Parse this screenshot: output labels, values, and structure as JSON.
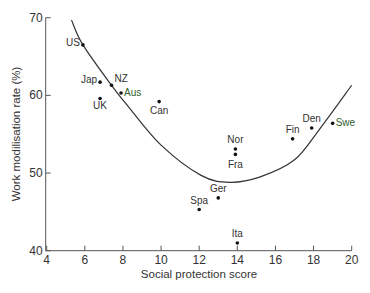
{
  "chart_data": {
    "type": "scatter",
    "title": "",
    "xlabel": "Social protection score",
    "ylabel": "Work modilisation rate (%)",
    "xlim": [
      4,
      20
    ],
    "ylim": [
      40,
      70
    ],
    "xticks": [
      4,
      6,
      8,
      10,
      12,
      14,
      16,
      18,
      20
    ],
    "yticks": [
      40,
      50,
      60,
      70
    ],
    "grid": false,
    "legend": null,
    "points": [
      {
        "label": "US",
        "x": 5.9,
        "y": 66.5
      },
      {
        "label": "Jap",
        "x": 6.8,
        "y": 61.7
      },
      {
        "label": "NZ",
        "x": 7.4,
        "y": 61.3
      },
      {
        "label": "Aus",
        "x": 7.9,
        "y": 60.3
      },
      {
        "label": "UK",
        "x": 6.8,
        "y": 59.6
      },
      {
        "label": "Can",
        "x": 9.9,
        "y": 59.2
      },
      {
        "label": "Nor",
        "x": 13.9,
        "y": 53.1
      },
      {
        "label": "Fra",
        "x": 13.9,
        "y": 52.4
      },
      {
        "label": "Ger",
        "x": 13.0,
        "y": 46.8
      },
      {
        "label": "Spa",
        "x": 12.0,
        "y": 45.3
      },
      {
        "label": "Ita",
        "x": 14.0,
        "y": 41.0
      },
      {
        "label": "Fin",
        "x": 16.9,
        "y": 54.4
      },
      {
        "label": "Den",
        "x": 17.9,
        "y": 55.8
      },
      {
        "label": "Swe",
        "x": 19.0,
        "y": 56.4
      }
    ],
    "fit_curve": {
      "type": "U-shaped (quadratic) fit",
      "points": [
        [
          5.3,
          69.7
        ],
        [
          5.9,
          66.5
        ],
        [
          7.4,
          61.3
        ],
        [
          8.3,
          58.5
        ],
        [
          10.0,
          53.6
        ],
        [
          12.1,
          49.7
        ],
        [
          13.6,
          48.8
        ],
        [
          15.2,
          49.5
        ],
        [
          17.0,
          51.7
        ],
        [
          18.3,
          55.6
        ],
        [
          20.0,
          61.3
        ]
      ]
    },
    "colors": {
      "points": "#111111",
      "curve": "#333333",
      "axis": "#555555",
      "label_accent": "#2e5e2e"
    }
  },
  "caption_fragment": ""
}
